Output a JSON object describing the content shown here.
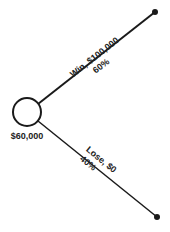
{
  "diagram": {
    "type": "decision-tree",
    "root": {
      "label": "$60,000",
      "shape": "circle"
    },
    "branches": [
      {
        "name": "win",
        "outcome_label": "Win, $100,000",
        "probability_label": "60%"
      },
      {
        "name": "lose",
        "outcome_label": "Lose, $0",
        "probability_label": "40%"
      }
    ],
    "colors": {
      "line": "#1a1a1a",
      "text": "#222222",
      "background": "#ffffff"
    }
  }
}
